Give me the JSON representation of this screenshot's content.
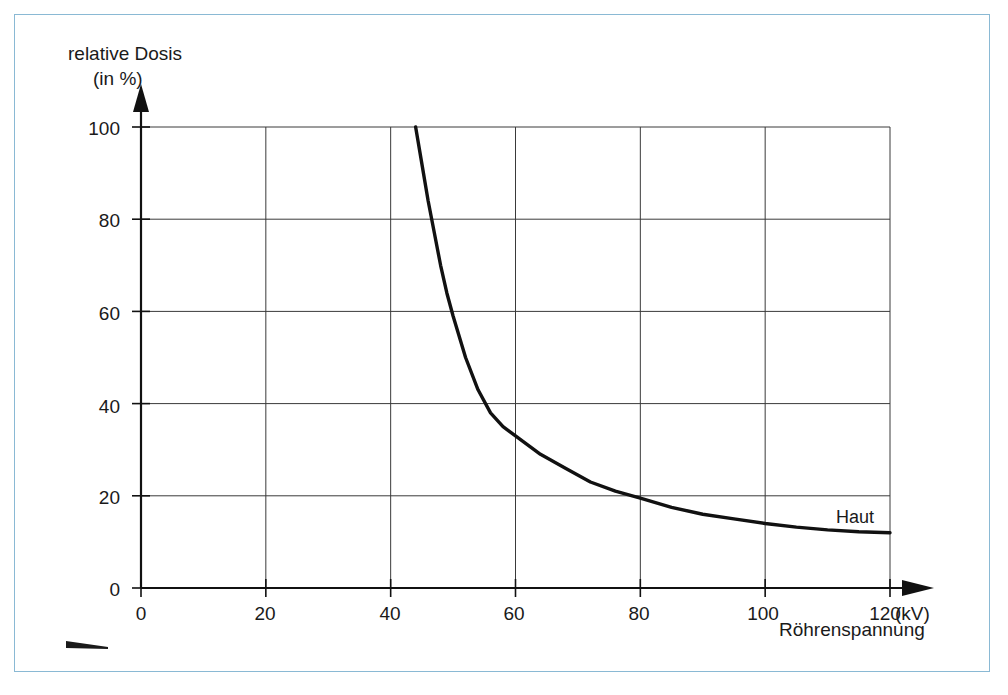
{
  "frame": {
    "border_color": "#8ab9d4"
  },
  "chart_data": {
    "type": "line",
    "title": "",
    "subtitle": "",
    "ylabel": "relative Dosis",
    "ylabel_unit": "(in %)",
    "xlabel": "Röhrenspannung",
    "xunit": "(kV)",
    "xlim": [
      0,
      120
    ],
    "ylim": [
      0,
      100
    ],
    "xticks": [
      0,
      20,
      40,
      60,
      80,
      100,
      120
    ],
    "yticks": [
      0,
      20,
      40,
      60,
      80,
      100
    ],
    "xtick_labels": [
      "0",
      "20",
      "40",
      "60",
      "80",
      "100",
      "120"
    ],
    "ytick_labels": [
      "0",
      "20",
      "40",
      "60",
      "80",
      "100"
    ],
    "grid": true,
    "grid_color": "#3a3a3a",
    "legend_position": "inline-right",
    "series": [
      {
        "name": "Haut",
        "color": "#111111",
        "x": [
          44,
          45,
          46,
          47,
          48,
          49,
          50,
          52,
          54,
          56,
          58,
          60,
          64,
          68,
          72,
          76,
          80,
          85,
          90,
          95,
          100,
          105,
          110,
          115,
          120
        ],
        "values": [
          100,
          92,
          84,
          77,
          70,
          64,
          59,
          50,
          43,
          38,
          35,
          33,
          29,
          26,
          23,
          21,
          19.5,
          17.5,
          16,
          15,
          14,
          13.2,
          12.6,
          12.2,
          12
        ]
      }
    ],
    "annotations": [
      {
        "text": "Haut",
        "x": 112,
        "y": 20
      }
    ]
  },
  "marks": {
    "corner_dash": "tapered-dash"
  }
}
